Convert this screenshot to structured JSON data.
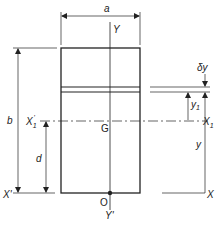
{
  "diagram": {
    "labels": {
      "width": "a",
      "height": "b",
      "strip_thickness": "δy",
      "strip_distance_from_centroid": "y",
      "strip_distance_from_centroid_sub": "1",
      "distance_from_base": "y",
      "centroid_offset": "d",
      "centroid": "G",
      "origin": "O",
      "y_axis_top": "Y",
      "y_axis_bottom": "Y'",
      "x_axis_left": "X'",
      "x_axis_right": "X",
      "x1_axis_left": "X",
      "x1_axis_left_sub": "1",
      "x1_axis_left_prime": "'",
      "x1_axis_right": "X",
      "x1_axis_right_sub": "1"
    },
    "colors": {
      "line": "#222222",
      "background": "#ffffff"
    }
  }
}
